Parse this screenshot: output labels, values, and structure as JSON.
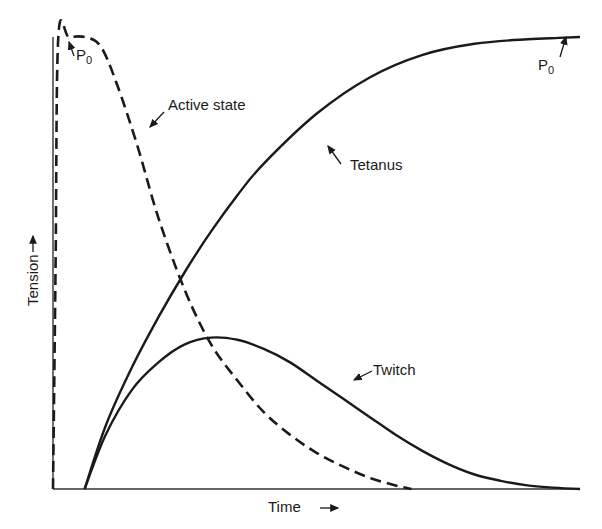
{
  "chart_data": {
    "type": "line",
    "title": "",
    "xlabel": "Time",
    "ylabel": "Tension",
    "xlabel_arrow": "→",
    "ylabel_arrow": "→",
    "grid": false,
    "legend": "none (curves labeled directly with arrows)",
    "xlim": [
      0,
      100
    ],
    "ylim": [
      0,
      100
    ],
    "ticks": "none",
    "series": [
      {
        "name": "Active state",
        "style": "dashed",
        "x": [
          0,
          0.5,
          1,
          3,
          6,
          9,
          12,
          16,
          20,
          25,
          30,
          35,
          40,
          45,
          50,
          55,
          60,
          65,
          68
        ],
        "y": [
          0,
          50,
          100,
          100,
          100,
          98,
          90,
          76,
          60,
          44,
          32,
          24,
          17,
          12,
          8,
          5,
          2.5,
          0.8,
          0
        ]
      },
      {
        "name": "Tetanus",
        "style": "solid",
        "x": [
          6,
          10,
          15,
          20,
          25,
          30,
          35,
          40,
          50,
          60,
          70,
          80,
          90,
          96,
          100
        ],
        "y": [
          0,
          14,
          27,
          38,
          48,
          57,
          65,
          72,
          83,
          91,
          96,
          98.5,
          99.5,
          99.8,
          100
        ]
      },
      {
        "name": "Twitch",
        "style": "solid",
        "x": [
          6,
          10,
          15,
          20,
          25,
          30,
          35,
          40,
          45,
          50,
          55,
          60,
          65,
          70,
          75,
          80,
          85,
          90,
          95,
          100
        ],
        "y": [
          0,
          12,
          22,
          28,
          32,
          33.5,
          33,
          31,
          28,
          24,
          20,
          16,
          12,
          8.5,
          5.5,
          3.2,
          1.8,
          0.8,
          0.3,
          0
        ]
      }
    ],
    "annotations": [
      {
        "text": "P",
        "subscript": "0",
        "target": "Active state plateau (max tension)"
      },
      {
        "text": "Active state",
        "target": "Active state curve"
      },
      {
        "text": "Tetanus",
        "target": "Tetanus curve"
      },
      {
        "text": "Twitch",
        "target": "Twitch curve"
      },
      {
        "text": "P",
        "subscript": "0",
        "target": "Tetanus plateau (max tension)"
      }
    ]
  },
  "labels": {
    "active_state": "Active state",
    "tetanus": "Tetanus",
    "twitch": "Twitch",
    "p": "P",
    "p_sub": "0",
    "x_axis": "Time",
    "y_axis": "Tension",
    "x_arrow": "⟶",
    "y_arrow": "⟶"
  },
  "colors": {
    "ink": "#1a1a1a",
    "background": "#ffffff"
  }
}
